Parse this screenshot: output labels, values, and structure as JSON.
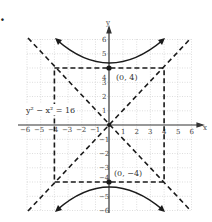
{
  "figure": {
    "label": ".",
    "equation": "y² − x² = 16",
    "axis_x_label": "x",
    "axis_y_label": "y",
    "vertex_top_label": "(0, 4)",
    "vertex_bottom_label": "(0, −4)",
    "x_ticks": [
      "−6",
      "−5",
      "−4",
      "−3",
      "−2",
      "−1",
      "1",
      "2",
      "3",
      "4",
      "5",
      "6"
    ],
    "y_ticks": [
      "6",
      "5",
      "4",
      "3",
      "2",
      "1",
      "−1",
      "−2",
      "−3",
      "−4",
      "−5",
      "−6"
    ]
  },
  "colors": {
    "ink": "#1a1a1a",
    "grid": "#c8c8c8"
  }
}
